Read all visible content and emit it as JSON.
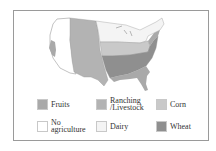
{
  "map": {
    "title": "",
    "regions": [
      {
        "name": "Fruits",
        "color": "#a9a9a9"
      },
      {
        "name": "Ranching /Livestock",
        "color": "#b3b3b3"
      },
      {
        "name": "Corn",
        "color": "#c9c9c9"
      },
      {
        "name": "No agriculture",
        "color": "#ffffff"
      },
      {
        "name": "Dairy",
        "color": "#f4f4f4"
      },
      {
        "name": "Wheat",
        "color": "#8f8f8f"
      }
    ]
  },
  "legend": {
    "items": [
      {
        "label": "Fruits",
        "color": "#a9a9a9"
      },
      {
        "label": "Ranching\n/Livestock",
        "color": "#b3b3b3"
      },
      {
        "label": "Corn",
        "color": "#c9c9c9"
      },
      {
        "label": "No\nagriculture",
        "color": "#ffffff"
      },
      {
        "label": "Dairy",
        "color": "#f4f4f4"
      },
      {
        "label": "Wheat",
        "color": "#8f8f8f"
      }
    ]
  }
}
